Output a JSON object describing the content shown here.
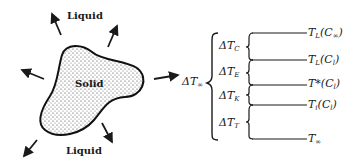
{
  "diagram": {
    "left": {
      "liquid_top_label": "Liquid",
      "liquid_bottom_label": "Liquid",
      "solid_label": "Solid",
      "arrows": [
        "upper-left",
        "upper-right",
        "left",
        "lower-right",
        "lower-left",
        "right-pointer"
      ]
    },
    "total_undercooling": {
      "symbol": "ΔT",
      "sub": "∞"
    },
    "contributions": [
      {
        "symbol": "ΔT",
        "sub": "C"
      },
      {
        "symbol": "ΔT",
        "sub": "E"
      },
      {
        "symbol": "ΔT",
        "sub": "K"
      },
      {
        "symbol": "ΔT",
        "sub": "T"
      }
    ],
    "temperature_levels": [
      {
        "main": "T",
        "sub": "L",
        "arg": "(C",
        "arg_sub": "∞",
        "close": ")"
      },
      {
        "main": "T",
        "sub": "L",
        "arg": "(C",
        "arg_sub": "l",
        "close": ")"
      },
      {
        "main": "T*",
        "sub": "",
        "arg": "(C",
        "arg_sub": "l",
        "close": ")"
      },
      {
        "main": "T",
        "sub": "i",
        "arg": "(C",
        "arg_sub": "l",
        "close": ")"
      },
      {
        "main": "T",
        "sub": "∞",
        "arg": "",
        "arg_sub": "",
        "close": ""
      }
    ],
    "colors": {
      "ink": "#1a1a1a",
      "background": "#ffffff"
    }
  }
}
